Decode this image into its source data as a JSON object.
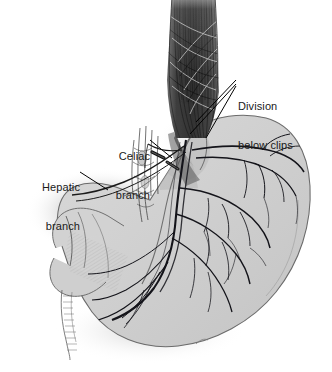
{
  "figure": {
    "kind": "medical-illustration",
    "width": 332,
    "height": 372,
    "background_color": "#ffffff"
  },
  "palette": {
    "background": "#ffffff",
    "stomach_fill": "#cdcdcd",
    "stomach_fill_light": "#d8d8d8",
    "stomach_edge": "#6f6f6f",
    "esophagus_dark": "#4a4a4a",
    "esophagus_darkest": "#2e2e2e",
    "nerve_line": "#15151a",
    "shadow": "#bdbdbd",
    "label_text": "#1a1a1a",
    "leader_line": "#000000"
  },
  "annotations": [
    {
      "id": "division-below-clips",
      "line1": "Division",
      "line2": "below clips",
      "align": "left",
      "x": 238,
      "y": 74
    },
    {
      "id": "celiac-branch",
      "line1": "Celiac",
      "line2": "branch",
      "align": "right",
      "x": 88,
      "y": 124,
      "width": 62
    },
    {
      "id": "hepatic-branch",
      "line1": "Hepatic",
      "line2": "branch",
      "align": "right",
      "x": 14,
      "y": 155,
      "width": 66
    }
  ],
  "structures": [
    {
      "id": "esophagus",
      "label": "Esophagus with longitudinal muscle fibers"
    },
    {
      "id": "stomach-body",
      "label": "Stomach body and fundus"
    },
    {
      "id": "lesser-curvature",
      "label": "Lesser curvature"
    },
    {
      "id": "greater-curvature",
      "label": "Greater curvature"
    },
    {
      "id": "pylorus",
      "label": "Pylorus"
    },
    {
      "id": "duodenum",
      "label": "Duodenum"
    },
    {
      "id": "anterior-vagus-trunk",
      "label": "Anterior vagus nerve trunk"
    },
    {
      "id": "gastric-nerve-branches",
      "label": "Gastric nerve branches"
    },
    {
      "id": "celiac-plexus-filaments",
      "label": "Celiac plexus filaments"
    },
    {
      "id": "surgical-clips",
      "label": "Surgical clips"
    }
  ]
}
